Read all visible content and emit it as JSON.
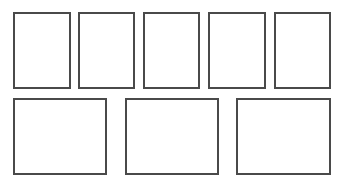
{
  "diagram": {
    "border_color": "#4a4a4a",
    "background": "#ffffff",
    "rows": [
      {
        "name": "top-row",
        "boxes": [
          {
            "x": 13,
            "y": 12,
            "w": 58,
            "h": 77
          },
          {
            "x": 78,
            "y": 12,
            "w": 57,
            "h": 77
          },
          {
            "x": 143,
            "y": 12,
            "w": 57,
            "h": 77
          },
          {
            "x": 208,
            "y": 12,
            "w": 58,
            "h": 77
          },
          {
            "x": 274,
            "y": 12,
            "w": 57,
            "h": 77
          }
        ]
      },
      {
        "name": "bottom-row",
        "boxes": [
          {
            "x": 13,
            "y": 98,
            "w": 94,
            "h": 77
          },
          {
            "x": 125,
            "y": 98,
            "w": 94,
            "h": 77
          },
          {
            "x": 236,
            "y": 98,
            "w": 95,
            "h": 77
          }
        ]
      }
    ]
  }
}
